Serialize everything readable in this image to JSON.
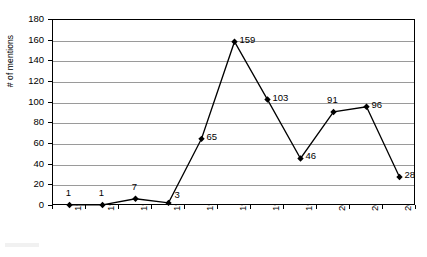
{
  "chart_data": {
    "type": "line",
    "title": "",
    "xlabel": "",
    "ylabel": "# of mentions",
    "categories": [
      "1992",
      "1993",
      "1994",
      "1995",
      "1996",
      "1997",
      "1998",
      "1999",
      "2000",
      "2001",
      "2002"
    ],
    "values": [
      1,
      1,
      7,
      3,
      65,
      159,
      103,
      46,
      91,
      96,
      28
    ],
    "series": [
      {
        "name": "# of mentions",
        "values": [
          1,
          1,
          7,
          3,
          65,
          159,
          103,
          46,
          91,
          96,
          28
        ]
      }
    ],
    "ylim": [
      0,
      180
    ],
    "ytick_values": [
      0,
      20,
      40,
      60,
      80,
      100,
      120,
      140,
      160,
      180
    ],
    "ytick_labels": [
      "0",
      "20",
      "40",
      "60",
      "80",
      "100",
      "120",
      "140",
      "160",
      "180"
    ],
    "grid": "horizontal",
    "legend": "none",
    "marker": "diamond",
    "marker_color": "#000000",
    "line_color": "#000000",
    "gridline_color": "#9a9a9a",
    "data_labels": [
      {
        "text": "1",
        "value": 1,
        "category": "1992",
        "position": "above"
      },
      {
        "text": "1",
        "value": 1,
        "category": "1993",
        "position": "above"
      },
      {
        "text": "7",
        "value": 7,
        "category": "1994",
        "position": "above"
      },
      {
        "text": "3",
        "value": 3,
        "category": "1995",
        "position": "above-right"
      },
      {
        "text": "65",
        "value": 65,
        "category": "1996",
        "position": "right"
      },
      {
        "text": "159",
        "value": 159,
        "category": "1997",
        "position": "right"
      },
      {
        "text": "103",
        "value": 103,
        "category": "1998",
        "position": "right"
      },
      {
        "text": "46",
        "value": 46,
        "category": "1999",
        "position": "right"
      },
      {
        "text": "91",
        "value": 91,
        "category": "2000",
        "position": "above"
      },
      {
        "text": "96",
        "value": 96,
        "category": "2001",
        "position": "right"
      },
      {
        "text": "28",
        "value": 28,
        "category": "2002",
        "position": "right"
      }
    ]
  }
}
